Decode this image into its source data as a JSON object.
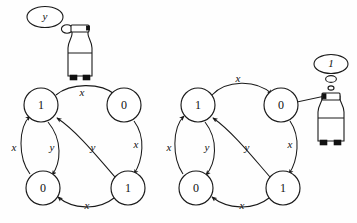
{
  "figure": {
    "title": "",
    "background_color": "#fefefe",
    "stroke_color": "#1a1a1a",
    "text_color": "#111111"
  },
  "diagrams": [
    {
      "id": "left-diagram",
      "robot": {
        "name": "robot-left",
        "thought_bubble_label": "y",
        "pointer_target": "top-edge-of-left-graph"
      },
      "nodes": [
        {
          "id": "L-top-left",
          "label": "1",
          "cx": 41,
          "cy": 105,
          "r": 17
        },
        {
          "id": "L-top-right",
          "label": "0",
          "cx": 124,
          "cy": 105,
          "r": 17
        },
        {
          "id": "L-bottom-left",
          "label": "0",
          "cx": 43,
          "cy": 188,
          "r": 17
        },
        {
          "id": "L-bottom-right",
          "label": "1",
          "cx": 128,
          "cy": 188,
          "r": 17
        }
      ],
      "edges": [
        {
          "id": "L-e1",
          "label": "x",
          "from": "L-top-left",
          "to": "L-top-right",
          "label_x": 82,
          "label_y": 93
        },
        {
          "id": "L-e2",
          "label": "x",
          "from": "L-bottom-left",
          "to": "L-top-left",
          "label_x": 14,
          "label_y": 148
        },
        {
          "id": "L-e3",
          "label": "y",
          "from": "L-top-left",
          "to": "L-bottom-left",
          "label_x": 52,
          "label_y": 148
        },
        {
          "id": "L-e4",
          "label": "y",
          "from": "L-bottom-right",
          "to": "L-top-left",
          "label_x": 93,
          "label_y": 148
        },
        {
          "id": "L-e5",
          "label": "x",
          "from": "L-top-right",
          "to": "L-bottom-right",
          "label_x": 136,
          "label_y": 145
        },
        {
          "id": "L-e6",
          "label": "x",
          "from": "L-bottom-right",
          "to": "L-bottom-left",
          "label_x": 87,
          "label_y": 205
        }
      ]
    },
    {
      "id": "right-diagram",
      "robot": {
        "name": "robot-right",
        "thought_bubble_label": "1",
        "pointer_target": "R-top-right"
      },
      "nodes": [
        {
          "id": "R-top-left",
          "label": "1",
          "cx": 198,
          "cy": 105,
          "r": 17
        },
        {
          "id": "R-top-right",
          "label": "0",
          "cx": 281,
          "cy": 105,
          "r": 17
        },
        {
          "id": "R-bottom-left",
          "label": "0",
          "cx": 196,
          "cy": 188,
          "r": 17
        },
        {
          "id": "R-bottom-right",
          "label": "1",
          "cx": 283,
          "cy": 188,
          "r": 17
        }
      ],
      "edges": [
        {
          "id": "R-e1",
          "label": "x",
          "from": "R-top-left",
          "to": "R-top-right",
          "label_x": 238,
          "label_y": 79
        },
        {
          "id": "R-e2",
          "label": "x",
          "from": "R-bottom-left",
          "to": "R-top-left",
          "label_x": 169,
          "label_y": 148
        },
        {
          "id": "R-e3",
          "label": "y",
          "from": "R-top-left",
          "to": "R-bottom-left",
          "label_x": 207,
          "label_y": 148
        },
        {
          "id": "R-e4",
          "label": "y",
          "from": "R-bottom-right",
          "to": "R-top-left",
          "label_x": 247,
          "label_y": 148
        },
        {
          "id": "R-e5",
          "label": "x",
          "from": "R-top-right",
          "to": "R-bottom-right",
          "label_x": 290,
          "label_y": 145
        },
        {
          "id": "R-e6",
          "label": "x",
          "from": "R-bottom-right",
          "to": "R-bottom-left",
          "label_x": 242,
          "label_y": 205
        }
      ]
    }
  ]
}
